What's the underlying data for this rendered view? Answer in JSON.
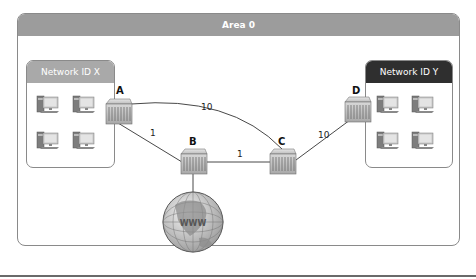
{
  "area": {
    "title": "Area 0",
    "header_color": "#9c9c9c"
  },
  "networks": [
    {
      "id": "x",
      "label": "Network ID X",
      "header_color": "#a9a9a9",
      "hosts": 4
    },
    {
      "id": "y",
      "label": "Network ID Y",
      "header_color": "#2f2f2f",
      "hosts": 4
    }
  ],
  "routers": [
    {
      "name": "A"
    },
    {
      "name": "B"
    },
    {
      "name": "C"
    },
    {
      "name": "D"
    }
  ],
  "links": [
    {
      "from": "A",
      "to": "C",
      "cost": "10"
    },
    {
      "from": "A",
      "to": "B",
      "cost": "1"
    },
    {
      "from": "B",
      "to": "C",
      "cost": "1"
    },
    {
      "from": "C",
      "to": "D",
      "cost": "10"
    },
    {
      "from": "B",
      "to": "Internet",
      "cost": ""
    }
  ],
  "internet": {
    "icon": "globe-icon"
  }
}
